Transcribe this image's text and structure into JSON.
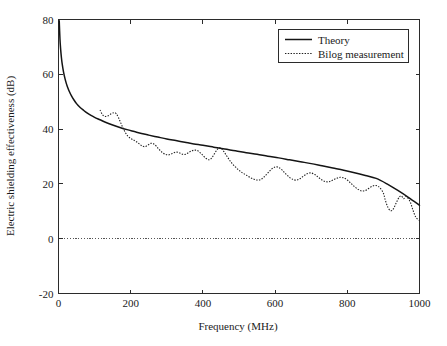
{
  "chart_data": {
    "type": "line",
    "title": "",
    "xlabel": "Frequency (MHz)",
    "ylabel": "Electric shielding effectiveness (dB)",
    "xlim": [
      0,
      1000
    ],
    "ylim": [
      -20,
      80
    ],
    "xticks": [
      0,
      200,
      400,
      600,
      800,
      1000
    ],
    "yticks": [
      -20,
      0,
      20,
      40,
      60,
      80
    ],
    "xtick_labels": [
      "0",
      "200",
      "400",
      "600",
      "800",
      "1000"
    ],
    "ytick_labels": [
      "-20",
      "0",
      "20",
      "40",
      "60",
      "80"
    ],
    "grid": false,
    "legend_position": "top-right",
    "reference_lines": [
      {
        "name": "zero-db-line",
        "axis": "y",
        "value": 0,
        "style": "dotted"
      }
    ],
    "series": [
      {
        "name": "Theory",
        "style": "solid",
        "color": "#141414",
        "x": [
          2,
          4,
          6,
          8,
          10,
          14,
          18,
          22,
          26,
          30,
          36,
          42,
          50,
          60,
          70,
          80,
          90,
          100,
          115,
          130,
          150,
          170,
          190,
          210,
          230,
          250,
          275,
          300,
          325,
          350,
          375,
          400,
          430,
          460,
          490,
          520,
          550,
          580,
          610,
          640,
          670,
          700,
          730,
          760,
          790,
          820,
          850,
          880,
          910,
          940,
          970,
          1000
        ],
        "y": [
          79.5,
          73.0,
          69.0,
          66.2,
          64.0,
          60.8,
          58.4,
          56.5,
          55.0,
          53.7,
          52.1,
          50.8,
          49.3,
          47.9,
          46.8,
          45.8,
          45.0,
          44.3,
          43.4,
          42.5,
          41.5,
          40.6,
          39.8,
          39.1,
          38.4,
          37.8,
          37.1,
          36.4,
          35.8,
          35.2,
          34.6,
          34.1,
          33.4,
          32.7,
          32.1,
          31.4,
          30.8,
          30.1,
          29.5,
          28.8,
          28.1,
          27.4,
          26.6,
          25.8,
          25.0,
          24.1,
          23.1,
          22.0,
          20.0,
          17.6,
          15.0,
          12.2
        ]
      },
      {
        "name": "Bilog measurement",
        "style": "dotted",
        "color": "#1f1f1f",
        "x": [
          115,
          122,
          130,
          138,
          146,
          154,
          160,
          166,
          172,
          178,
          185,
          192,
          200,
          208,
          216,
          224,
          232,
          240,
          248,
          256,
          264,
          272,
          280,
          288,
          296,
          304,
          312,
          320,
          328,
          336,
          344,
          352,
          360,
          368,
          376,
          384,
          392,
          400,
          408,
          416,
          424,
          432,
          440,
          448,
          456,
          464,
          472,
          480,
          490,
          500,
          510,
          520,
          530,
          540,
          550,
          560,
          570,
          580,
          590,
          600,
          610,
          620,
          630,
          640,
          650,
          660,
          670,
          680,
          690,
          700,
          710,
          720,
          730,
          740,
          750,
          760,
          770,
          780,
          790,
          800,
          810,
          820,
          830,
          840,
          850,
          860,
          870,
          880,
          890,
          900,
          905,
          912,
          920,
          928,
          936,
          944,
          950,
          956,
          962,
          968,
          975,
          982,
          990,
          1000
        ],
        "y": [
          47.0,
          45.2,
          44.6,
          44.9,
          45.6,
          46.0,
          45.6,
          44.2,
          42.4,
          40.6,
          38.8,
          37.4,
          36.6,
          36.0,
          35.4,
          34.6,
          33.8,
          33.6,
          34.2,
          34.8,
          34.6,
          33.6,
          32.4,
          31.4,
          30.8,
          30.6,
          30.9,
          31.4,
          31.6,
          31.3,
          30.8,
          30.8,
          31.4,
          32.0,
          32.3,
          32.2,
          31.4,
          30.4,
          29.4,
          28.8,
          29.4,
          31.0,
          32.6,
          33.2,
          32.2,
          30.6,
          29.0,
          27.6,
          26.2,
          25.0,
          24.0,
          23.2,
          22.4,
          21.8,
          21.4,
          21.6,
          22.6,
          24.0,
          25.4,
          26.2,
          26.0,
          25.0,
          23.6,
          22.4,
          21.6,
          21.4,
          22.0,
          23.0,
          23.8,
          24.0,
          23.4,
          22.4,
          21.4,
          20.8,
          20.8,
          21.4,
          22.0,
          22.4,
          22.2,
          21.4,
          20.2,
          19.0,
          18.0,
          17.4,
          17.6,
          18.4,
          19.2,
          19.4,
          18.6,
          16.6,
          14.2,
          11.6,
          10.2,
          11.0,
          13.2,
          15.2,
          15.6,
          14.6,
          15.4,
          14.8,
          13.2,
          10.4,
          7.8,
          6.6
        ]
      }
    ]
  },
  "legend": {
    "entries": [
      {
        "label": "Theory",
        "style": "solid"
      },
      {
        "label": "Bilog measurement",
        "style": "dotted"
      }
    ]
  },
  "colors": {
    "background": "#ffffff",
    "axis": "#2b2b2b",
    "theory": "#141414",
    "measurement": "#1f1f1f"
  }
}
